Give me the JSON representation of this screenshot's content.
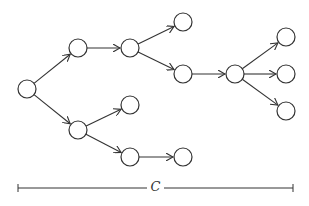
{
  "diagram": {
    "type": "tree",
    "node_radius": 9,
    "stroke_color": "#333333",
    "nodes": [
      {
        "id": "n0",
        "x": 27,
        "y": 89
      },
      {
        "id": "n1",
        "x": 78,
        "y": 48
      },
      {
        "id": "n2",
        "x": 78,
        "y": 130
      },
      {
        "id": "n3",
        "x": 130,
        "y": 48
      },
      {
        "id": "n4",
        "x": 183,
        "y": 22
      },
      {
        "id": "n5",
        "x": 183,
        "y": 74
      },
      {
        "id": "n6",
        "x": 235,
        "y": 74
      },
      {
        "id": "n7",
        "x": 286,
        "y": 37
      },
      {
        "id": "n8",
        "x": 286,
        "y": 74
      },
      {
        "id": "n9",
        "x": 286,
        "y": 111
      },
      {
        "id": "n10",
        "x": 130,
        "y": 105
      },
      {
        "id": "n11",
        "x": 130,
        "y": 157
      },
      {
        "id": "n12",
        "x": 183,
        "y": 157
      }
    ],
    "edges": [
      [
        "n0",
        "n1"
      ],
      [
        "n0",
        "n2"
      ],
      [
        "n1",
        "n3"
      ],
      [
        "n3",
        "n4"
      ],
      [
        "n3",
        "n5"
      ],
      [
        "n5",
        "n6"
      ],
      [
        "n6",
        "n7"
      ],
      [
        "n6",
        "n8"
      ],
      [
        "n6",
        "n9"
      ],
      [
        "n2",
        "n10"
      ],
      [
        "n2",
        "n11"
      ],
      [
        "n11",
        "n12"
      ]
    ],
    "span": {
      "label": "C",
      "x1": 18,
      "x2": 293,
      "y": 188
    }
  }
}
